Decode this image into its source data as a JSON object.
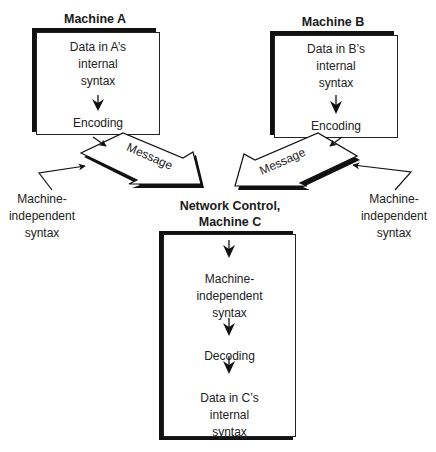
{
  "machine_a": {
    "title": "Machine A",
    "lines": [
      "Data in A’s",
      "internal",
      "syntax"
    ],
    "step": "Encoding"
  },
  "machine_b": {
    "title": "Machine B",
    "lines": [
      "Data in B’s",
      "internal",
      "syntax"
    ],
    "step": "Encoding"
  },
  "machine_c": {
    "title_line1": "Network Control,",
    "title_line2": "Machine C",
    "input_lines": [
      "Machine-",
      "independent",
      "syntax"
    ],
    "step": "Decoding",
    "output_lines": [
      "Data in C’s",
      "internal",
      "syntax"
    ]
  },
  "messages": {
    "a_label": "Message",
    "b_label": "Message"
  },
  "callouts": {
    "left": [
      "Machine-",
      "independent",
      "syntax"
    ],
    "right": [
      "Machine-",
      "independent",
      "syntax"
    ]
  }
}
